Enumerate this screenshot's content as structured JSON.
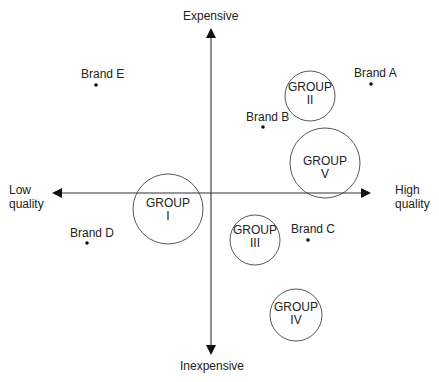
{
  "diagram": {
    "type": "perceptual-map",
    "axes": {
      "vertical_top": "Expensive",
      "vertical_bottom": "Inexpensive",
      "horizontal_left_line1": "Low",
      "horizontal_left_line2": "quality",
      "horizontal_right_line1": "High",
      "horizontal_right_line2": "quality"
    },
    "groups": [
      {
        "label": "GROUP",
        "numeral": "I",
        "cx": 168,
        "cy": 209,
        "r": 35
      },
      {
        "label": "GROUP",
        "numeral": "II",
        "cx": 310,
        "cy": 96,
        "r": 25
      },
      {
        "label": "GROUP",
        "numeral": "III",
        "cx": 255,
        "cy": 240,
        "r": 25
      },
      {
        "label": "GROUP",
        "numeral": "IV",
        "cx": 296,
        "cy": 315,
        "r": 26
      },
      {
        "label": "GROUP",
        "numeral": "V",
        "cx": 325,
        "cy": 163,
        "r": 35
      }
    ],
    "brands": [
      {
        "label": "Brand A",
        "x": 371,
        "y": 84
      },
      {
        "label": "Brand B",
        "x": 263,
        "y": 127
      },
      {
        "label": "Brand C",
        "x": 308,
        "y": 240
      },
      {
        "label": "Brand D",
        "x": 87,
        "y": 243
      },
      {
        "label": "Brand E",
        "x": 96,
        "y": 85
      }
    ],
    "colors": {
      "line": "#333333",
      "text": "#222222",
      "background": "#ffffff"
    }
  }
}
